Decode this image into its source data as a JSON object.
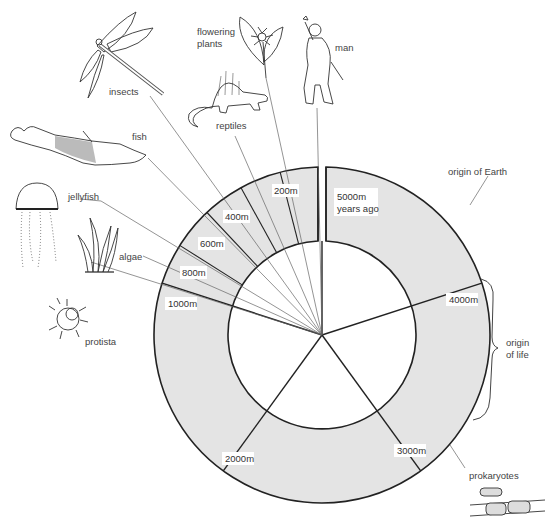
{
  "diagram": {
    "center": [
      322,
      335
    ],
    "outer_radius": 168,
    "inner_radius": 94,
    "colors": {
      "ring_fill": "#e4e4e4",
      "line": "#222222",
      "leader": "#555555",
      "text": "#444444"
    },
    "time_labels": [
      {
        "id": "t5000",
        "text_lines": [
          "5000m",
          "years ago"
        ],
        "x": 337,
        "y": 197
      },
      {
        "id": "t4000",
        "text": "4000m",
        "x": 449,
        "y": 301
      },
      {
        "id": "t3000",
        "text": "3000m",
        "x": 397,
        "y": 453
      },
      {
        "id": "t2000",
        "text": "2000m",
        "x": 225,
        "y": 461
      },
      {
        "id": "t1000",
        "text": "1000m",
        "x": 168,
        "y": 305
      },
      {
        "id": "t800",
        "text": "800m",
        "x": 183,
        "y": 276
      },
      {
        "id": "t600",
        "text": "600m",
        "x": 201,
        "y": 246
      },
      {
        "id": "t400",
        "text": "400m",
        "x": 226,
        "y": 219
      },
      {
        "id": "t200",
        "text": "200m",
        "x": 275,
        "y": 193
      }
    ],
    "annotations": [
      {
        "id": "origin-of-earth",
        "text": "origin of Earth",
        "x": 448,
        "y": 172
      },
      {
        "id": "origin-of-life",
        "text_lines": [
          "origin",
          "of life"
        ],
        "x": 505,
        "y": 348
      },
      {
        "id": "prokaryotes",
        "text": "prokaryotes",
        "x": 470,
        "y": 478
      }
    ],
    "organisms": [
      {
        "id": "man",
        "label": "man",
        "x": 336,
        "y": 50
      },
      {
        "id": "flowering-plants",
        "label_lines": [
          "flowering",
          "plants"
        ],
        "x": 197,
        "y": 35
      },
      {
        "id": "reptiles",
        "label": "reptiles",
        "x": 217,
        "y": 130
      },
      {
        "id": "insects",
        "label": "insects",
        "x": 110,
        "y": 96
      },
      {
        "id": "fish",
        "label": "fish",
        "x": 133,
        "y": 141
      },
      {
        "id": "jellyfish",
        "label": "jellyfish",
        "x": 68,
        "y": 198
      },
      {
        "id": "algae",
        "label": "algae",
        "x": 119,
        "y": 257
      },
      {
        "id": "protista",
        "label": "protista",
        "x": 86,
        "y": 341
      }
    ]
  }
}
